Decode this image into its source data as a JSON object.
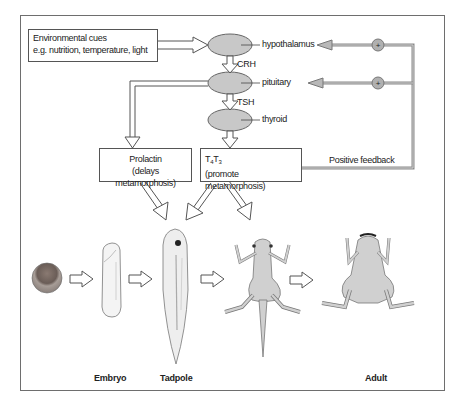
{
  "diagram": {
    "type": "biological pathway",
    "input_box": {
      "line1": "Environmental cues",
      "line2": "e.g. nutrition, temperature, light"
    },
    "glands": [
      {
        "name": "hypothalamus"
      },
      {
        "name": "pituitary"
      },
      {
        "name": "thyroid"
      }
    ],
    "hormones": {
      "crh": "CRH",
      "tsh": "TSH"
    },
    "prolactin_box": {
      "line1": "Prolactin",
      "line2": "(delays metamorphosis)"
    },
    "thyroid_hormone_box": {
      "t4": "T",
      "t4_sub": "4",
      "t3": "T",
      "t3_sub": "3",
      "line2": "(promote metamorphosis)"
    },
    "feedback": {
      "label": "Positive feedback",
      "sign": "+"
    },
    "stages": [
      {
        "name": "egg",
        "label": ""
      },
      {
        "name": "embryo",
        "label": "Embryo"
      },
      {
        "name": "tadpole",
        "label": "Tadpole"
      },
      {
        "name": "metamorphosing-froglet",
        "label": ""
      },
      {
        "name": "adult",
        "label": "Adult"
      }
    ],
    "colors": {
      "gland_fill": "#c8c8c8",
      "feedback_line": "#9a9a9a",
      "frame": "#6e6e6e",
      "frog_fill": "#d0d0d0"
    }
  }
}
